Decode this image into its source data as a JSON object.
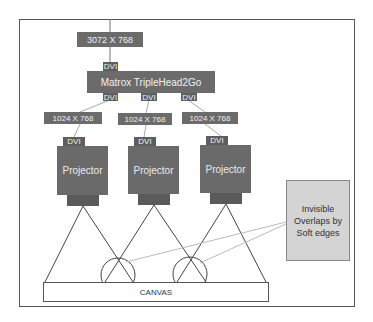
{
  "diagram": {
    "source": {
      "label": "3072 X 768"
    },
    "source_port": {
      "label": "DVI"
    },
    "splitter": {
      "label": "Matrox TripleHead2Go",
      "outputs": [
        "DVI",
        "DVI",
        "DVI"
      ]
    },
    "outputs": [
      {
        "resolution": "1024 X 768",
        "port": "DVI",
        "device": "Projector"
      },
      {
        "resolution": "1024 X 768",
        "port": "DVI",
        "device": "Projector"
      },
      {
        "resolution": "1024 X 768",
        "port": "DVI",
        "device": "Projector"
      }
    ],
    "canvas": {
      "label": "CANVAS"
    },
    "note": {
      "text": "Invisible Overlaps by Soft edges"
    }
  },
  "colors": {
    "box_fill": "#6b6b6b",
    "note_fill": "#d4d4d4",
    "line": "#555555"
  }
}
